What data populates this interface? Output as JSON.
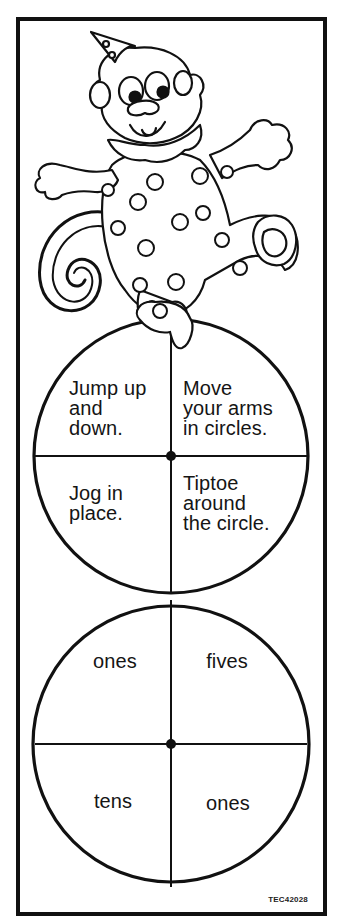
{
  "document": {
    "type": "spinner cutout worksheet",
    "illustration": "clown monkey with party hat, polka-dot suit, curled tail",
    "colors": {
      "ink": "#111111",
      "paper": "#ffffff"
    }
  },
  "spinner_top": {
    "sections": [
      {
        "position": "top-left",
        "text": "Jump up\nand\ndown."
      },
      {
        "position": "top-right",
        "text": "Move\nyour arms\nin circles."
      },
      {
        "position": "bottom-left",
        "text": "Jog in\nplace."
      },
      {
        "position": "bottom-right",
        "text": "Tiptoe\naround\nthe circle."
      }
    ]
  },
  "spinner_bottom": {
    "sections": [
      {
        "position": "top-left",
        "text": "ones"
      },
      {
        "position": "top-right",
        "text": "fives"
      },
      {
        "position": "bottom-left",
        "text": "tens"
      },
      {
        "position": "bottom-right",
        "text": "ones"
      }
    ]
  },
  "footer": {
    "code": "TEC42028"
  }
}
